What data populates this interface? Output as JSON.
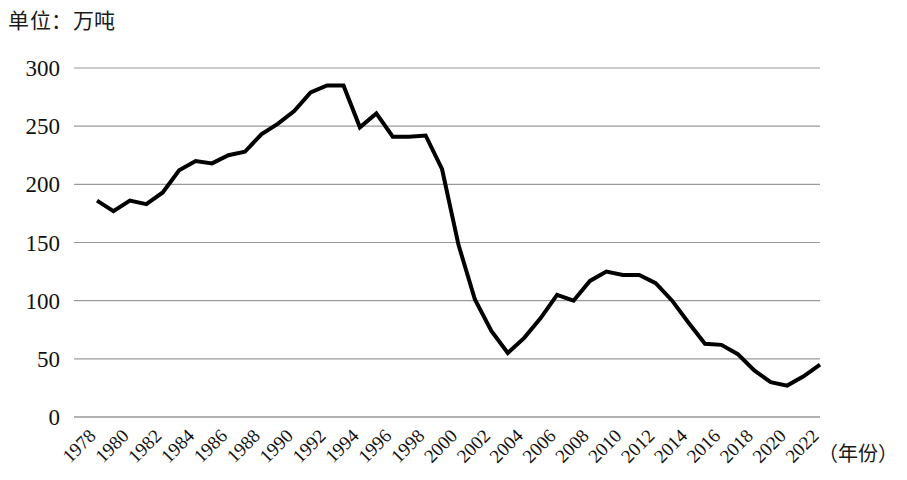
{
  "unit_title": "单位：万吨",
  "x_axis_caption": "（年份）",
  "chart_data": {
    "type": "line",
    "title": "单位：万吨",
    "xlabel": "（年份）",
    "ylabel": "万吨",
    "ylim": [
      0,
      300
    ],
    "ytick_labels": [
      "0",
      "50",
      "100",
      "150",
      "200",
      "250",
      "300"
    ],
    "ytick_values": [
      0,
      50,
      100,
      150,
      200,
      250,
      300
    ],
    "xlim": [
      1978,
      2022
    ],
    "xtick_labels": [
      "1978",
      "1980",
      "1982",
      "1984",
      "1986",
      "1988",
      "1990",
      "1992",
      "1994",
      "1996",
      "1998",
      "2000",
      "2002",
      "2004",
      "2006",
      "2008",
      "2010",
      "2012",
      "2014",
      "2016",
      "2018",
      "2020",
      "2022"
    ],
    "xtick_values": [
      1978,
      1980,
      1982,
      1984,
      1986,
      1988,
      1990,
      1992,
      1994,
      1996,
      1998,
      2000,
      2002,
      2004,
      2006,
      2008,
      2010,
      2012,
      2014,
      2016,
      2018,
      2020,
      2022
    ],
    "xtick_rotation": 45,
    "grid": "horizontal",
    "legend": "none",
    "line_color": "#000000",
    "line_width": 4,
    "x": [
      1978,
      1979,
      1980,
      1981,
      1982,
      1983,
      1984,
      1985,
      1986,
      1987,
      1988,
      1989,
      1990,
      1991,
      1992,
      1993,
      1994,
      1995,
      1996,
      1997,
      1998,
      1999,
      2000,
      2001,
      2002,
      2003,
      2004,
      2005,
      2006,
      2007,
      2008,
      2009,
      2010,
      2011,
      2012,
      2013,
      2014,
      2015,
      2016,
      2017,
      2018,
      2019,
      2020,
      2021,
      2022
    ],
    "values": [
      186,
      177,
      186,
      183,
      193,
      212,
      220,
      218,
      225,
      228,
      243,
      252,
      263,
      279,
      285,
      285,
      249,
      261,
      241,
      241,
      242,
      213,
      148,
      101,
      74,
      55,
      68,
      85,
      105,
      100,
      117,
      125,
      122,
      122,
      115,
      100,
      81,
      63,
      62,
      54,
      40,
      30,
      27,
      35,
      45
    ]
  }
}
